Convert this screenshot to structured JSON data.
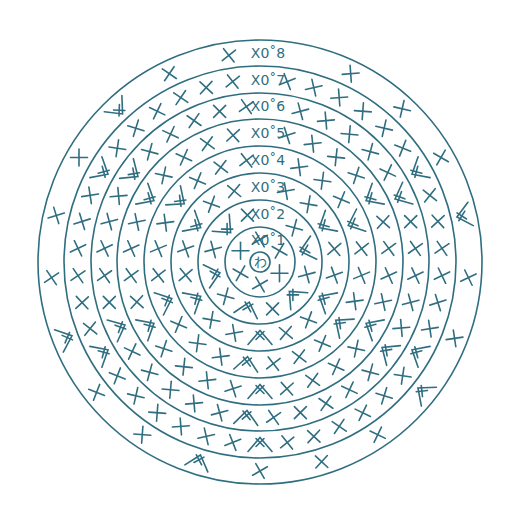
{
  "diagram": {
    "color": "#2f6e80",
    "center": {
      "x": 260,
      "y": 262
    },
    "center_symbol": {
      "label": "わ",
      "meaning": "magic ring",
      "radius": 10
    },
    "ring_radii": [
      35,
      62,
      89,
      116,
      143,
      169,
      196,
      222
    ],
    "rounds": [
      {
        "round": 1,
        "label": "X0̊1",
        "label_text": "×0 1",
        "count": 6,
        "increases": []
      },
      {
        "round": 2,
        "label_text": "×0 2",
        "count": 12,
        "increases": [
          0,
          1,
          2,
          3,
          4,
          5
        ]
      },
      {
        "round": 3,
        "label_text": "×0 3",
        "count": 18,
        "increases": [
          0,
          1,
          2,
          3,
          4,
          5
        ]
      },
      {
        "round": 4,
        "label_text": "×0 4",
        "count": 24,
        "increases": [
          0,
          1,
          2,
          3,
          4,
          5
        ]
      },
      {
        "round": 5,
        "label_text": "×0 5",
        "count": 30,
        "increases": [
          0,
          1,
          2,
          3,
          4,
          5
        ]
      },
      {
        "round": 6,
        "label_text": "×0 6",
        "count": 36,
        "increases": [
          0,
          1,
          2,
          3,
          4,
          5
        ]
      },
      {
        "round": 7,
        "label_text": "×0 7",
        "count": 42,
        "increases": [
          0,
          1,
          2,
          3,
          4,
          5
        ]
      },
      {
        "round": 8,
        "label_text": "×0 8",
        "count": 42,
        "increases": [
          0,
          1,
          2,
          3,
          4,
          5
        ],
        "sparse": true
      }
    ],
    "legend_labels": [
      "X0˚1",
      "X0˚2",
      "X0˚3",
      "X0˚4",
      "X0˚5",
      "X0˚6",
      "X0˚7",
      "X0˚8"
    ],
    "symbols": {
      "single_crochet": "X",
      "increase": "V",
      "center": "わ"
    }
  }
}
